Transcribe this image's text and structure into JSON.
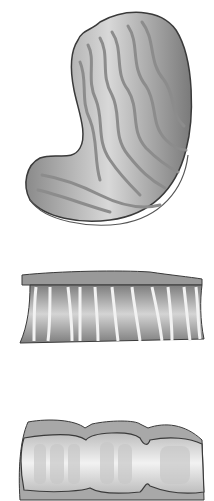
{
  "figures": [
    {
      "name": "stomach-illustration",
      "description": "Stomach with wavy rugae folds",
      "colors": {
        "fill": "#b8b8b8",
        "fold": "#8c8c8c",
        "outline": "#3a3a3a"
      }
    },
    {
      "name": "stretched-tube-illustration",
      "description": "Tube segment with vertical white striations",
      "colors": {
        "fill": "#9a9a9a",
        "stripe": "#f0f0f0",
        "outline": "#3a3a3a"
      }
    },
    {
      "name": "segmented-tube-illustration",
      "description": "Constricted tube segments with lumen folds",
      "colors": {
        "fill": "#a8a8a8",
        "inner": "#e4e4e4",
        "outline": "#3a3a3a"
      }
    }
  ],
  "background": "#ffffff"
}
